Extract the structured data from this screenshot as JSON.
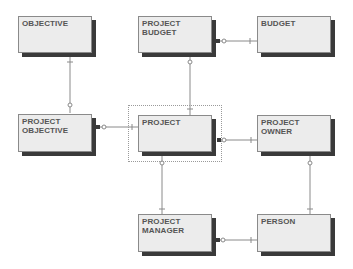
{
  "diagram": {
    "type": "entity-relationship",
    "entities": [
      {
        "id": "objective",
        "label": "OBJECTIVE"
      },
      {
        "id": "project_budget",
        "label": "PROJECT\nBUDGET"
      },
      {
        "id": "budget",
        "label": "BUDGET"
      },
      {
        "id": "project_objective",
        "label": "PROJECT\nOBJECTIVE"
      },
      {
        "id": "project",
        "label": "PROJECT",
        "selected": true
      },
      {
        "id": "project_owner",
        "label": "PROJECT\nOWNER"
      },
      {
        "id": "project_manager",
        "label": "PROJECT\nMANAGER"
      },
      {
        "id": "person",
        "label": "PERSON"
      }
    ],
    "relationships": [
      {
        "from": "objective",
        "to": "project_objective",
        "from_end": "one",
        "to_end": "zero-or-many"
      },
      {
        "from": "project_budget",
        "to": "budget",
        "from_end": "zero-or-many",
        "to_end": "one"
      },
      {
        "from": "project",
        "to": "project_budget",
        "from_end": "one",
        "to_end": "zero-or-many"
      },
      {
        "from": "project_objective",
        "to": "project",
        "from_end": "zero-or-many",
        "to_end": "one"
      },
      {
        "from": "project",
        "to": "project_owner",
        "from_end": "zero-or-many",
        "to_end": "one"
      },
      {
        "from": "project",
        "to": "project_manager",
        "from_end": "zero-or-many",
        "to_end": "one"
      },
      {
        "from": "project_manager",
        "to": "person",
        "from_end": "zero-or-many",
        "to_end": "one"
      },
      {
        "from": "project_owner",
        "to": "person",
        "from_end": "zero-or-many",
        "to_end": "one"
      }
    ]
  }
}
